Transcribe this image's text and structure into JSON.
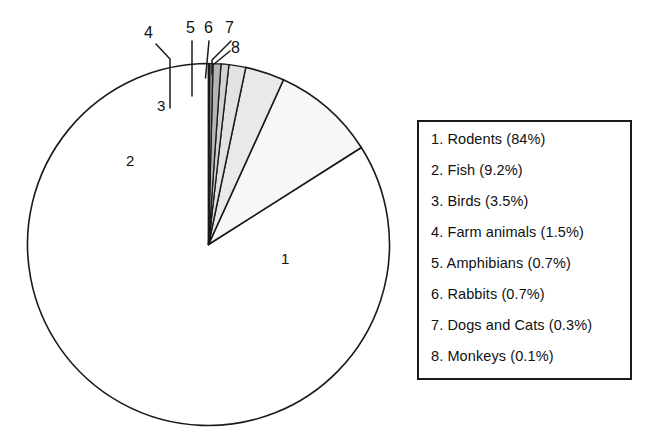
{
  "chart_data": {
    "type": "pie",
    "title": "",
    "xlabel": "",
    "ylabel": "",
    "legend_position": "right",
    "grid": false,
    "start_angle_deg": 90,
    "direction": "counterclockwise",
    "categories": [
      "Rodents",
      "Fish",
      "Birds",
      "Farm animals",
      "Amphibians",
      "Rabbits",
      "Dogs and Cats",
      "Monkeys"
    ],
    "values": [
      84,
      9.2,
      3.5,
      1.5,
      0.7,
      0.7,
      0.3,
      0.1
    ],
    "unit": "%",
    "slices": [
      {
        "index": "1",
        "name": "Rodents",
        "value": 84,
        "percent_text": "84%",
        "fill": "#ffffff",
        "label": "1"
      },
      {
        "index": "2",
        "name": "Fish",
        "value": 9.2,
        "percent_text": "9.2%",
        "fill": "#f7f7f7",
        "label": "2"
      },
      {
        "index": "3",
        "name": "Birds",
        "value": 3.5,
        "percent_text": "3.5%",
        "fill": "#e9e9e9",
        "label": "3"
      },
      {
        "index": "4",
        "name": "Farm animals",
        "value": 1.5,
        "percent_text": "1.5%",
        "fill": "#e2e2e2",
        "label": "4"
      },
      {
        "index": "5",
        "name": "Amphibians",
        "value": 0.7,
        "percent_text": "0.7%",
        "fill": "#d2d2d2",
        "label": "5"
      },
      {
        "index": "6",
        "name": "Rabbits",
        "value": 0.7,
        "percent_text": "0.7%",
        "fill": "#b4b4b4",
        "label": "6"
      },
      {
        "index": "7",
        "name": "Dogs and Cats",
        "value": 0.3,
        "percent_text": "0.3%",
        "fill": "#8a8a8a",
        "label": "7"
      },
      {
        "index": "8",
        "name": "Monkeys",
        "value": 0.1,
        "percent_text": "0.1%",
        "fill": "#1c1c1c",
        "label": "8"
      }
    ],
    "legend_entries": [
      "1. Rodents (84%)",
      "2. Fish (9.2%)",
      "3. Birds (3.5%)",
      "4. Farm animals (1.5%)",
      "5. Amphibians (0.7%)",
      "6. Rabbits (0.7%)",
      "7. Dogs and Cats (0.3%)",
      "8. Monkeys (0.1%)"
    ],
    "inner_labels": [
      "1",
      "2",
      "3"
    ],
    "callout_labels": [
      "4",
      "5",
      "6",
      "7",
      "8"
    ],
    "colors": {
      "outline": "#1a1a1a",
      "legend_border": "#1a1a1a",
      "text": "#111111",
      "background": "#ffffff"
    }
  }
}
